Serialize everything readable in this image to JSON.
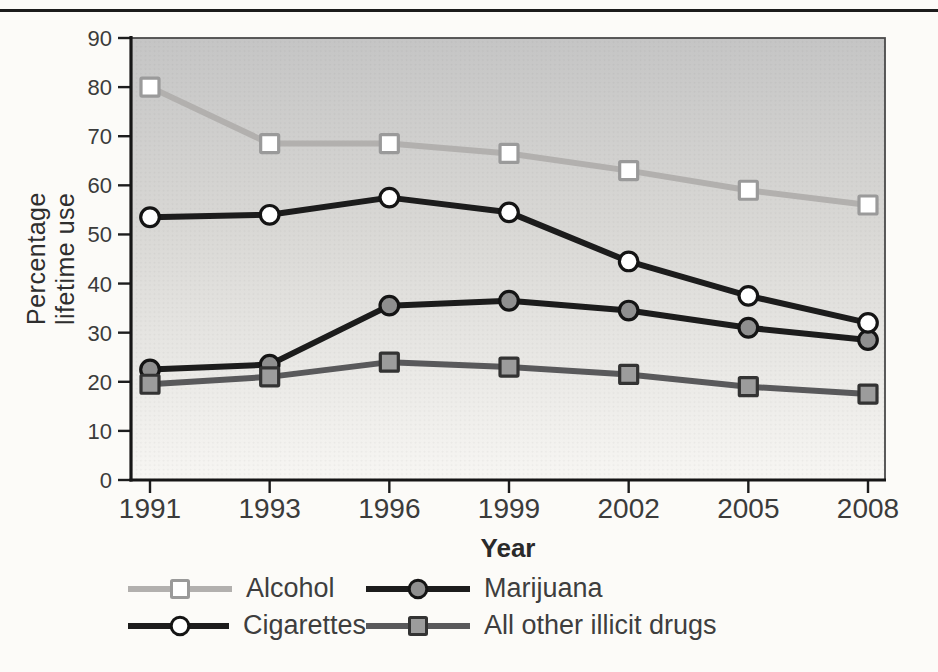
{
  "page": {
    "top_rule": true
  },
  "chart_data": {
    "type": "line",
    "title": "",
    "xlabel": "Year",
    "ylabel": "Percentage lifetime use",
    "categories": [
      "1991",
      "1993",
      "1996",
      "1999",
      "2002",
      "2005",
      "2008"
    ],
    "ylim": [
      0,
      90
    ],
    "y_ticks": [
      0,
      10,
      20,
      30,
      40,
      50,
      60,
      70,
      80,
      90
    ],
    "grid": false,
    "legend_position": "bottom-two-columns",
    "plot_background": {
      "top": "#c5c5c5",
      "mid": "#dad9d6",
      "bottom": "#f7f6f3"
    },
    "axis_color": "#1d1d1d",
    "tick_label_color": "#3b3b3b",
    "series": [
      {
        "name": "Alcohol",
        "values": [
          80,
          68.5,
          68.5,
          66.5,
          63,
          59,
          56
        ],
        "line_color": "#b2b0ae",
        "marker": "square",
        "marker_fill": "#ffffff",
        "marker_stroke": "#9a9a9a"
      },
      {
        "name": "Cigarettes",
        "values": [
          53.5,
          54,
          57.5,
          54.5,
          44.5,
          37.5,
          32
        ],
        "line_color": "#1c1c1c",
        "marker": "circle",
        "marker_fill": "#ffffff",
        "marker_stroke": "#141414"
      },
      {
        "name": "Marijuana",
        "values": [
          22.5,
          23.5,
          35.5,
          36.5,
          34.5,
          31,
          28.5
        ],
        "line_color": "#1c1c1c",
        "marker": "circle",
        "marker_fill": "#8f8f8f",
        "marker_stroke": "#141414"
      },
      {
        "name": "All other illicit drugs",
        "values": [
          19.5,
          21,
          24,
          23,
          21.5,
          19,
          17.5
        ],
        "line_color": "#59595b",
        "marker": "square",
        "marker_fill": "#9c9c9c",
        "marker_stroke": "#333333"
      }
    ]
  }
}
